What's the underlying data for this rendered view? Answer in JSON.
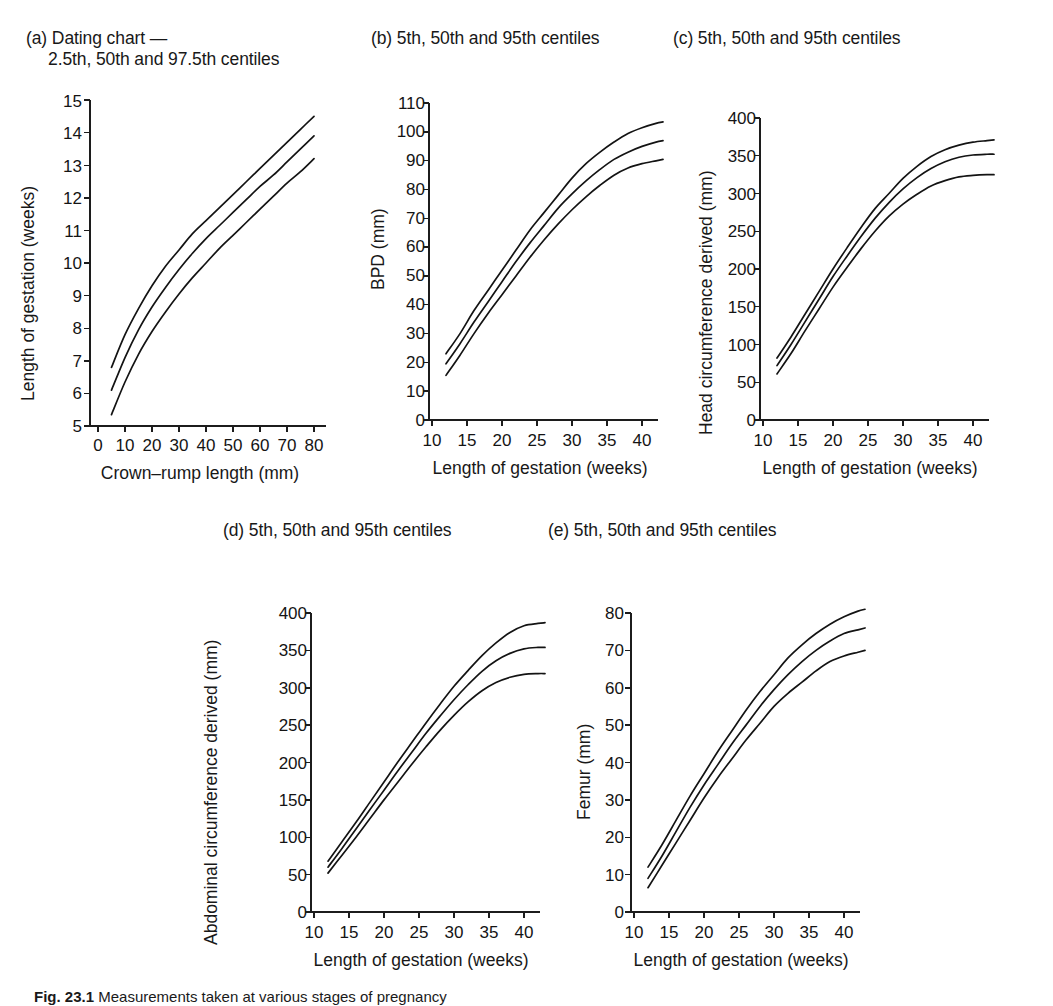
{
  "figure": {
    "caption_label": "Fig. 23.1",
    "caption_text": "Measurements taken at various stages of pregnancy",
    "panel_count": 5
  },
  "panels": {
    "a": {
      "title_line1": "(a) Dating chart —",
      "title_line2": "2.5th, 50th and 97.5th centiles",
      "y_title": "Length of gestation (weeks)",
      "x_title": "Crown–rump length (mm)",
      "y_ticks": [
        "15",
        "14",
        "13",
        "12",
        "11",
        "10",
        "9",
        "8",
        "7",
        "6",
        "5"
      ],
      "x_ticks": [
        "0",
        "10",
        "20",
        "30",
        "40",
        "50",
        "60",
        "70",
        "80"
      ]
    },
    "b": {
      "title": "(b) 5th, 50th and 95th centiles",
      "y_title": "BPD (mm)",
      "x_title": "Length of gestation (weeks)",
      "y_ticks": [
        "110",
        "100",
        "90",
        "80",
        "70",
        "60",
        "50",
        "40",
        "30",
        "20",
        "10",
        "0"
      ],
      "x_ticks": [
        "10",
        "15",
        "20",
        "25",
        "30",
        "35",
        "40"
      ]
    },
    "c": {
      "title": "(c) 5th, 50th and 95th centiles",
      "y_title": "Head circumference derived (mm)",
      "x_title": "Length of gestation (weeks)",
      "y_ticks": [
        "400",
        "350",
        "300",
        "250",
        "200",
        "150",
        "100",
        "50",
        "0"
      ],
      "x_ticks": [
        "10",
        "15",
        "20",
        "25",
        "30",
        "35",
        "40"
      ]
    },
    "d": {
      "title": "(d) 5th, 50th and 95th centiles",
      "y_title": "Abdominal circumference derived (mm)",
      "x_title": "Length of gestation (weeks)",
      "y_ticks": [
        "400",
        "350",
        "300",
        "250",
        "200",
        "150",
        "100",
        "50",
        "0"
      ],
      "x_ticks": [
        "10",
        "15",
        "20",
        "25",
        "30",
        "35",
        "40"
      ]
    },
    "e": {
      "title": "(e) 5th, 50th and 95th centiles",
      "y_title": "Femur (mm)",
      "x_title": "Length of gestation (weeks)",
      "y_ticks": [
        "80",
        "70",
        "60",
        "50",
        "40",
        "30",
        "20",
        "10",
        "0"
      ],
      "x_ticks": [
        "10",
        "15",
        "20",
        "25",
        "30",
        "35",
        "40"
      ]
    }
  },
  "chart_data": [
    {
      "id": "a",
      "type": "line",
      "title": "(a) Dating chart — 2.5th, 50th and 97.5th centiles",
      "xlabel": "Crown–rump length (mm)",
      "ylabel": "Length of gestation (weeks)",
      "xlim": [
        0,
        85
      ],
      "ylim": [
        5,
        15
      ],
      "xticks": [
        0,
        10,
        20,
        30,
        40,
        50,
        60,
        70,
        80
      ],
      "yticks": [
        5,
        6,
        7,
        8,
        9,
        10,
        11,
        12,
        13,
        14,
        15
      ],
      "grid": false,
      "legend": "none",
      "x": [
        5,
        10,
        15,
        20,
        25,
        30,
        35,
        40,
        45,
        50,
        55,
        60,
        65,
        70,
        75,
        80
      ],
      "series": [
        {
          "name": "97.5th centile",
          "values": [
            6.8,
            7.8,
            8.6,
            9.3,
            9.9,
            10.4,
            10.9,
            11.3,
            11.7,
            12.1,
            12.5,
            12.9,
            13.3,
            13.7,
            14.1,
            14.5
          ]
        },
        {
          "name": "50th centile",
          "values": [
            6.1,
            7.1,
            7.95,
            8.65,
            9.25,
            9.8,
            10.3,
            10.75,
            11.15,
            11.55,
            11.95,
            12.35,
            12.7,
            13.1,
            13.5,
            13.9
          ]
        },
        {
          "name": "2.5th centile",
          "values": [
            5.35,
            6.35,
            7.2,
            7.9,
            8.5,
            9.05,
            9.55,
            10.0,
            10.45,
            10.85,
            11.25,
            11.65,
            12.05,
            12.45,
            12.8,
            13.2
          ]
        }
      ]
    },
    {
      "id": "b",
      "type": "line",
      "title": "(b) 5th, 50th and 95th centiles",
      "xlabel": "Length of gestation (weeks)",
      "ylabel": "BPD (mm)",
      "xlim": [
        9,
        43.5
      ],
      "ylim": [
        0,
        110
      ],
      "xticks": [
        10,
        15,
        20,
        25,
        30,
        35,
        40
      ],
      "yticks": [
        0,
        10,
        20,
        30,
        40,
        50,
        60,
        70,
        80,
        90,
        100,
        110
      ],
      "grid": false,
      "legend": "none",
      "x": [
        12,
        14,
        16,
        18,
        20,
        22,
        24,
        26,
        28,
        30,
        32,
        34,
        36,
        38,
        40,
        42,
        43
      ],
      "series": [
        {
          "name": "95th centile",
          "values": [
            23,
            30,
            38,
            45,
            52,
            59,
            66,
            72,
            78,
            84,
            89,
            93,
            96.5,
            99.5,
            101.5,
            103,
            103.5
          ]
        },
        {
          "name": "50th centile",
          "values": [
            19.5,
            26.5,
            34,
            41,
            48,
            55,
            61.5,
            67.5,
            73.5,
            78.5,
            83,
            87,
            90.5,
            93,
            95,
            96.5,
            97
          ]
        },
        {
          "name": "5th centile",
          "values": [
            15.5,
            22.5,
            30,
            37,
            43.5,
            50,
            56.5,
            62.5,
            68,
            73,
            77.5,
            81.5,
            85,
            87.5,
            89,
            90,
            90.5
          ]
        }
      ]
    },
    {
      "id": "c",
      "type": "line",
      "title": "(c) 5th, 50th and 95th centiles",
      "xlabel": "Length of gestation (weeks)",
      "ylabel": "Head circumference derived (mm)",
      "xlim": [
        9,
        43.5
      ],
      "ylim": [
        0,
        400
      ],
      "xticks": [
        10,
        15,
        20,
        25,
        30,
        35,
        40
      ],
      "yticks": [
        0,
        50,
        100,
        150,
        200,
        250,
        300,
        350,
        400
      ],
      "grid": false,
      "legend": "none",
      "x": [
        12,
        14,
        16,
        18,
        20,
        22,
        24,
        26,
        28,
        30,
        32,
        34,
        36,
        38,
        40,
        42,
        43
      ],
      "series": [
        {
          "name": "95th centile",
          "values": [
            82,
            110,
            140,
            170,
            200,
            228,
            255,
            280,
            300,
            320,
            336,
            349,
            358,
            364,
            368,
            370,
            371
          ]
        },
        {
          "name": "50th centile",
          "values": [
            72,
            100,
            130,
            160,
            190,
            217,
            243,
            267,
            288,
            306,
            321,
            333,
            342,
            348,
            351,
            352,
            352
          ]
        },
        {
          "name": "5th centile",
          "values": [
            61,
            88,
            118,
            147,
            176,
            202,
            227,
            250,
            270,
            286,
            299,
            310,
            317,
            322,
            324,
            325,
            325
          ]
        }
      ]
    },
    {
      "id": "d",
      "type": "line",
      "title": "(d) 5th, 50th and 95th centiles",
      "xlabel": "Length of gestation (weeks)",
      "ylabel": "Abdominal circumference derived (mm)",
      "xlim": [
        9,
        43.5
      ],
      "ylim": [
        0,
        400
      ],
      "xticks": [
        10,
        15,
        20,
        25,
        30,
        35,
        40
      ],
      "yticks": [
        0,
        50,
        100,
        150,
        200,
        250,
        300,
        350,
        400
      ],
      "grid": false,
      "legend": "none",
      "x": [
        12,
        14,
        16,
        18,
        20,
        22,
        24,
        26,
        28,
        30,
        32,
        34,
        36,
        38,
        40,
        42,
        43
      ],
      "series": [
        {
          "name": "95th centile",
          "values": [
            68,
            94,
            120,
            147,
            174,
            201,
            227,
            253,
            278,
            302,
            323,
            343,
            360,
            374,
            383,
            386,
            387
          ]
        },
        {
          "name": "50th centile",
          "values": [
            60,
            85,
            111,
            137,
            163,
            189,
            214,
            239,
            262,
            284,
            304,
            322,
            336,
            346,
            352,
            354,
            354
          ]
        },
        {
          "name": "5th centile",
          "values": [
            52,
            76,
            100,
            125,
            150,
            174,
            198,
            221,
            243,
            263,
            281,
            296,
            307,
            314,
            318,
            319,
            319
          ]
        }
      ]
    },
    {
      "id": "e",
      "type": "line",
      "title": "(e) 5th, 50th and 95th centiles",
      "xlabel": "Length of gestation (weeks)",
      "ylabel": "Femur (mm)",
      "xlim": [
        9,
        43.5
      ],
      "ylim": [
        0,
        80
      ],
      "xticks": [
        10,
        15,
        20,
        25,
        30,
        35,
        40
      ],
      "yticks": [
        0,
        10,
        20,
        30,
        40,
        50,
        60,
        70,
        80
      ],
      "grid": false,
      "legend": "none",
      "x": [
        12,
        14,
        16,
        18,
        20,
        22,
        24,
        26,
        28,
        30,
        32,
        34,
        36,
        38,
        40,
        42,
        43
      ],
      "series": [
        {
          "name": "95th centile",
          "values": [
            12,
            18,
            24.5,
            31,
            37,
            43,
            48.5,
            54,
            59,
            63.5,
            68,
            71.5,
            74.5,
            77,
            79,
            80.5,
            81
          ]
        },
        {
          "name": "50th centile",
          "values": [
            9,
            15,
            21.5,
            28,
            34,
            39.5,
            45,
            50,
            55,
            59.5,
            63.5,
            67,
            70,
            72.5,
            74.5,
            75.5,
            76
          ]
        },
        {
          "name": "5th centile",
          "values": [
            6.5,
            12.5,
            18.5,
            24.5,
            30.5,
            36,
            41,
            46,
            50.5,
            55,
            58.5,
            61.5,
            64.5,
            67,
            68.5,
            69.5,
            70
          ]
        }
      ]
    }
  ]
}
